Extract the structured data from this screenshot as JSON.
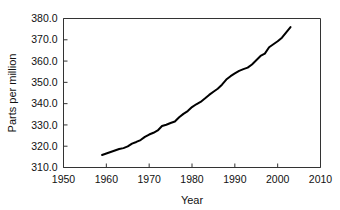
{
  "chart_data": {
    "type": "line",
    "title": "",
    "xlabel": "Year",
    "ylabel": "Parts per million",
    "xlim": [
      1950,
      2010
    ],
    "ylim": [
      310.0,
      380.0
    ],
    "xticks": [
      1950,
      1960,
      1970,
      1980,
      1990,
      2000,
      2010
    ],
    "xtick_labels": [
      "1950",
      "1960",
      "1970",
      "1980",
      "1990",
      "2000",
      "2010"
    ],
    "yticks": [
      310.0,
      320.0,
      330.0,
      340.0,
      350.0,
      360.0,
      370.0,
      380.0
    ],
    "ytick_labels": [
      "310.0",
      "320.0",
      "330.0",
      "340.0",
      "350.0",
      "360.0",
      "370.0",
      "380.0"
    ],
    "grid": false,
    "legend": false,
    "legend_position": "none",
    "line_color": "#000000",
    "line_width": 2.0,
    "series": [
      {
        "name": "Atmospheric carbon dioxide concentration",
        "x": [
          1959,
          1960,
          1961,
          1962,
          1963,
          1964,
          1965,
          1966,
          1967,
          1968,
          1969,
          1970,
          1971,
          1972,
          1973,
          1974,
          1975,
          1976,
          1977,
          1978,
          1979,
          1980,
          1981,
          1982,
          1983,
          1984,
          1985,
          1986,
          1987,
          1988,
          1989,
          1990,
          1991,
          1992,
          1993,
          1994,
          1995,
          1996,
          1997,
          1998,
          1999,
          2000,
          2001,
          2002,
          2003
        ],
        "values": [
          315.9,
          316.6,
          317.3,
          318.0,
          318.7,
          319.1,
          319.9,
          321.2,
          322.0,
          322.9,
          324.4,
          325.5,
          326.3,
          327.4,
          329.5,
          330.1,
          330.9,
          331.6,
          333.6,
          335.2,
          336.5,
          338.4,
          339.7,
          340.8,
          342.4,
          344.1,
          345.6,
          347.0,
          348.9,
          351.3,
          352.9,
          354.2,
          355.4,
          356.2,
          356.9,
          358.4,
          360.4,
          362.4,
          363.5,
          366.5,
          367.9,
          369.3,
          371.0,
          373.5,
          376.0
        ]
      }
    ]
  },
  "axes": {
    "x_title": "Year",
    "y_title": "Parts per million"
  }
}
